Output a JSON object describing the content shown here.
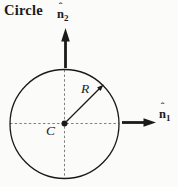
{
  "title": "Circle",
  "diagram": {
    "radius_label": "R",
    "center_label": "C",
    "axis1": {
      "base": "n",
      "hat": "ˆ",
      "subscript": "1"
    },
    "axis2": {
      "base": "n",
      "hat": "ˆ",
      "subscript": "2"
    },
    "colors": {
      "ink": "#1a1a1a",
      "dash_gray": "#808080",
      "background": "#fbfbfa"
    }
  }
}
